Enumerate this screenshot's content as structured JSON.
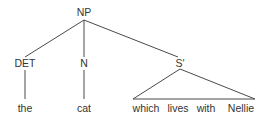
{
  "tree": {
    "root": {
      "label": "NP",
      "x": 85,
      "y": 16
    },
    "children": [
      {
        "label": "DET",
        "x": 25,
        "y": 67,
        "leaf": {
          "label": "the",
          "x": 25,
          "y": 112
        }
      },
      {
        "label": "N",
        "x": 84,
        "y": 67,
        "leaf": {
          "label": "cat",
          "x": 84,
          "y": 112
        }
      },
      {
        "label": "S′",
        "x": 180,
        "y": 67,
        "triangle": true,
        "leaves": [
          {
            "label": "which",
            "x": 146
          },
          {
            "label": "lives",
            "x": 178
          },
          {
            "label": "with",
            "x": 206
          },
          {
            "label": "Nellie",
            "x": 241
          }
        ]
      }
    ]
  }
}
